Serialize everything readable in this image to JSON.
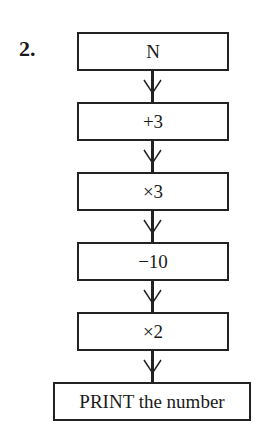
{
  "question_number": "2.",
  "flowchart": {
    "steps": [
      {
        "label": "N",
        "top": 32
      },
      {
        "label": "+3",
        "top": 102
      },
      {
        "label": "×3",
        "top": 172
      },
      {
        "label": "−10",
        "top": 242
      },
      {
        "label": "×2",
        "top": 312
      }
    ],
    "output": {
      "label": "PRINT the number",
      "top": 382
    },
    "connectors": [
      {
        "from": "N",
        "to": "+3"
      },
      {
        "from": "+3",
        "to": "×3"
      },
      {
        "from": "×3",
        "to": "−10"
      },
      {
        "from": "−10",
        "to": "×2"
      },
      {
        "from": "×2",
        "to": "PRINT the number"
      }
    ]
  }
}
